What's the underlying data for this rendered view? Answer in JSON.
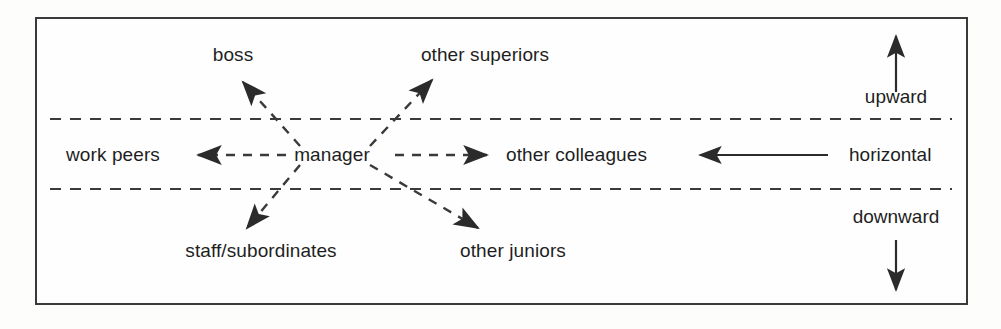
{
  "diagram": {
    "center_node": "manager",
    "nodes": {
      "boss": "boss",
      "other_superiors": "other superiors",
      "work_peers": "work peers",
      "other_colleagues": "other colleagues",
      "staff_subordinates": "staff/subordinates",
      "other_juniors": "other juniors"
    },
    "legend": {
      "upward": "upward",
      "horizontal": "horizontal",
      "downward": "downward"
    },
    "colors": {
      "ink": "#1e1e1e",
      "line": "#3a3a3a",
      "background": "#fefefe"
    },
    "bands": [
      {
        "name": "upward-band",
        "label": "upward"
      },
      {
        "name": "horizontal-band",
        "label": "horizontal"
      },
      {
        "name": "downward-band",
        "label": "downward"
      }
    ],
    "edges": [
      {
        "from": "manager",
        "to": "boss",
        "direction": "upward",
        "style": "dashed"
      },
      {
        "from": "manager",
        "to": "other superiors",
        "direction": "upward",
        "style": "dashed"
      },
      {
        "from": "manager",
        "to": "work peers",
        "direction": "horizontal",
        "style": "dashed"
      },
      {
        "from": "manager",
        "to": "other colleagues",
        "direction": "horizontal",
        "style": "dashed"
      },
      {
        "from": "manager",
        "to": "staff/subordinates",
        "direction": "downward",
        "style": "dashed"
      },
      {
        "from": "manager",
        "to": "other juniors",
        "direction": "downward",
        "style": "dashed"
      }
    ]
  }
}
